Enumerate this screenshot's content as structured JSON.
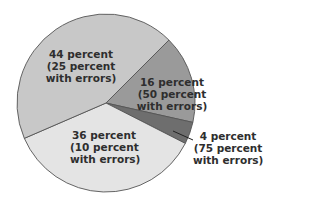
{
  "chart_data": {
    "type": "pie",
    "title": "",
    "start_angle_deg": 45,
    "direction": "clockwise",
    "center": [
      106,
      103
    ],
    "radius": 89,
    "slices": [
      {
        "label": "16 percent",
        "value": 16,
        "errors_label": "(50 percent",
        "errors_label2": "with errors)",
        "errors_percent": 50,
        "color": "#9a9a9a"
      },
      {
        "label": "4 percent",
        "value": 4,
        "errors_label": "(75 percent",
        "errors_label2": "with errors)",
        "errors_percent": 75,
        "color": "#6e6e6e"
      },
      {
        "label": "36 percent",
        "value": 36,
        "errors_label": "(10 percent",
        "errors_label2": "with errors)",
        "errors_percent": 10,
        "color": "#e4e4e4"
      },
      {
        "label": "44 percent",
        "value": 44,
        "errors_label": "(25 percent",
        "errors_label2": "with errors)",
        "errors_percent": 25,
        "color": "#c8c8c8"
      }
    ],
    "edge_color": "#555555",
    "legend": "none"
  }
}
